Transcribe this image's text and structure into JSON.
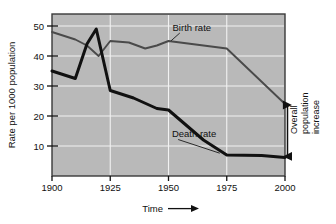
{
  "chart_data": {
    "type": "line",
    "title": "",
    "xlabel": "Time",
    "ylabel": "Rate per 1000 population",
    "xlim": [
      1900,
      2000
    ],
    "ylim": [
      0,
      54
    ],
    "xticks": [
      1900,
      1925,
      1950,
      1975,
      2000
    ],
    "yticks": [
      10,
      20,
      30,
      40,
      50
    ],
    "grid": true,
    "legend_position": "inline-annotation",
    "series": [
      {
        "name": "Birth rate",
        "points": [
          [
            1900,
            48.0
          ],
          [
            1910,
            45.5
          ],
          [
            1915,
            43.5
          ],
          [
            1920,
            40.0
          ],
          [
            1925,
            45.0
          ],
          [
            1933,
            44.5
          ],
          [
            1940,
            42.5
          ],
          [
            1945,
            43.5
          ],
          [
            1950,
            45.0
          ],
          [
            1960,
            44.0
          ],
          [
            1975,
            42.5
          ],
          [
            2000,
            24.0
          ]
        ]
      },
      {
        "name": "Death rate",
        "points": [
          [
            1900,
            35.0
          ],
          [
            1910,
            32.5
          ],
          [
            1915,
            44.0
          ],
          [
            1919,
            49.0
          ],
          [
            1925,
            28.5
          ],
          [
            1935,
            26.0
          ],
          [
            1945,
            22.5
          ],
          [
            1950,
            22.0
          ],
          [
            1965,
            12.0
          ],
          [
            1975,
            7.0
          ],
          [
            1990,
            6.8
          ],
          [
            2000,
            6.2
          ]
        ]
      }
    ],
    "annotations": [
      {
        "name": "birth-rate-label",
        "text": "Birth rate",
        "at": [
          1960,
          48.5
        ],
        "points_to": [
          1951,
          45.0
        ]
      },
      {
        "name": "death-rate-label",
        "text": "Death rate",
        "at": [
          1961,
          13.0
        ],
        "points_to": [
          1972,
          7.6
        ]
      },
      {
        "name": "overall-population-increase",
        "lines": [
          "Overall",
          "population",
          "increase"
        ],
        "arrow_from_value": 24.0,
        "arrow_to_value": 6.2,
        "arrow_at_year": 2000
      }
    ]
  },
  "axes": {
    "y_title": "Rate per 1000 population",
    "x_title": "Time",
    "x_arrow": "⟶",
    "y_tick_labels": [
      "50",
      "40",
      "30",
      "20",
      "10"
    ],
    "x_tick_labels": [
      "1900",
      "1925",
      "1950",
      "1975",
      "2000"
    ]
  },
  "labels": {
    "birth_rate": "Birth rate",
    "death_rate": "Death rate",
    "overall_1": "Overall",
    "overall_2": "population",
    "overall_3": "increase"
  },
  "colors": {
    "plot_background": "#b9b9b9",
    "plot_border": "#3a3a3a",
    "gridline": "#f2f2f2",
    "birth_line": "#4a4a4a",
    "death_line": "#111111",
    "text": "#111111",
    "page_background": "#ffffff"
  }
}
